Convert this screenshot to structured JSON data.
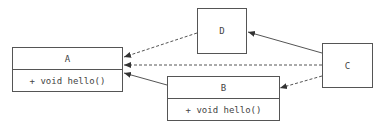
{
  "diagram": {
    "type": "uml-class",
    "nodes": [
      {
        "id": "A",
        "name": "A",
        "methods": [
          "+ void hello()"
        ]
      },
      {
        "id": "B",
        "name": "B",
        "methods": [
          "+ void hello()"
        ]
      },
      {
        "id": "C",
        "name": "C",
        "methods": []
      },
      {
        "id": "D",
        "name": "D",
        "methods": []
      }
    ],
    "edges": [
      {
        "from": "D",
        "to": "A",
        "style": "dashed",
        "arrow": "open"
      },
      {
        "from": "C",
        "to": "A",
        "style": "dashed",
        "arrow": "open"
      },
      {
        "from": "B",
        "to": "A",
        "style": "solid",
        "arrow": "open"
      },
      {
        "from": "C",
        "to": "D",
        "style": "solid",
        "arrow": "open"
      },
      {
        "from": "C",
        "to": "B",
        "style": "dashed",
        "arrow": "open"
      }
    ]
  },
  "colors": {
    "line": "#555555",
    "text": "#444444",
    "background": "#ffffff"
  }
}
